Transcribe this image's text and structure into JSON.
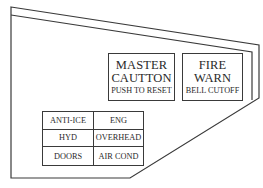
{
  "panel": {
    "master_caution": {
      "line1": "MASTER",
      "line2": "CAUTTON",
      "sub": "PUSH TO RESET"
    },
    "fire_warn": {
      "line1": "FIRE",
      "line2": "WARN",
      "sub": "BELL CUTOFF"
    },
    "annunciator_grid": [
      [
        "ANTI-ICE",
        "ENG"
      ],
      [
        "HYD",
        "OVERHEAD"
      ],
      [
        "DOORS",
        "AIR COND"
      ]
    ],
    "colors": {
      "line": "#3a3a3a",
      "background": "#ffffff"
    }
  }
}
